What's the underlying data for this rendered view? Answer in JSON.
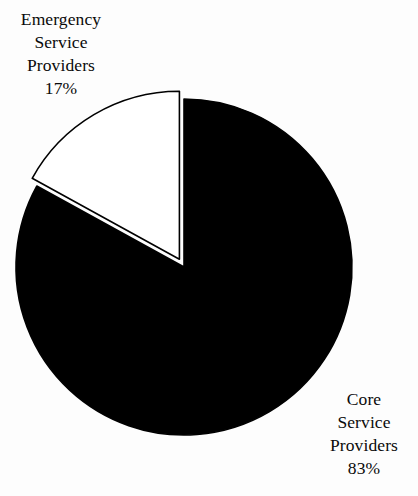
{
  "chart_data": {
    "type": "pie",
    "title": "",
    "subtitle": "",
    "xlabel": "",
    "ylabel": "",
    "legend_position": "none",
    "grid": false,
    "categories": [
      "Core Service Providers",
      "Emergency Service Providers"
    ],
    "values": [
      83,
      17
    ],
    "value_unit": "%",
    "slices": [
      {
        "name": "Core Service Providers",
        "value": 83,
        "percent_label": "83%",
        "color": "#000000",
        "stroke": "#000000",
        "exploded": false,
        "start_angle_deg": 0,
        "end_angle_deg": 298.8
      },
      {
        "name": "Emergency Service Providers",
        "value": 17,
        "percent_label": "17%",
        "color": "#ffffff",
        "stroke": "#000000",
        "exploded": true,
        "start_angle_deg": 298.8,
        "end_angle_deg": 360
      }
    ],
    "start_angle_deg": 0,
    "direction": "clockwise",
    "annotations": [
      {
        "for": "Emergency Service Providers",
        "position": "top-left",
        "lines": [
          "Emergency",
          "Service",
          "Providers",
          "17%"
        ]
      },
      {
        "for": "Core Service Providers",
        "position": "bottom-right",
        "lines": [
          "Core",
          "Service",
          "Providers",
          "83%"
        ]
      }
    ]
  },
  "geometry": {
    "center_x": 184,
    "center_y": 267,
    "radius": 168,
    "explode_offset": 9,
    "stroke_width": 1.6
  },
  "colors": {
    "background": "#fdfdfd",
    "core_slice": "#000000",
    "emergency_slice": "#ffffff",
    "outline": "#000000",
    "text": "#0a0a0a"
  },
  "labels": {
    "emergency": {
      "line1": "Emergency",
      "line2": "Service",
      "line3": "Providers",
      "line4": "17%"
    },
    "core": {
      "line1": "Core",
      "line2": "Service",
      "line3": "Providers",
      "line4": "83%"
    }
  }
}
